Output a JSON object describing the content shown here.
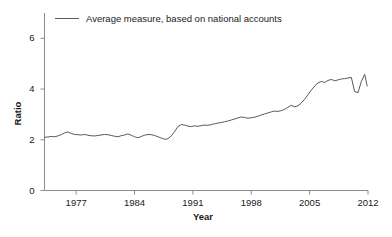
{
  "chart_data": {
    "type": "line",
    "title": "",
    "xlabel": "Year",
    "ylabel": "Ratio",
    "xlim": [
      1973.2,
      2012.0
    ],
    "ylim": [
      0,
      7.0
    ],
    "xticks": [
      1977,
      1984,
      1991,
      1998,
      2005,
      2012
    ],
    "xtick_labels": [
      "1977",
      "1984",
      "1991",
      "1998",
      "2005",
      "2012"
    ],
    "yticks": [
      0,
      2,
      4,
      6
    ],
    "ytick_labels": [
      "0",
      "2",
      "4",
      "6"
    ],
    "grid": false,
    "legend_position": "top-left",
    "line_color": "#595959",
    "axis_color": "#808080",
    "series": [
      {
        "name": "Average measure, based on national accounts",
        "x": [
          1973.2,
          1973.6,
          1974.0,
          1974.4,
          1974.8,
          1975.2,
          1975.6,
          1976.0,
          1976.4,
          1976.8,
          1977.2,
          1977.6,
          1978.0,
          1978.4,
          1978.8,
          1979.2,
          1979.6,
          1980.0,
          1980.4,
          1980.8,
          1981.2,
          1981.6,
          1982.0,
          1982.4,
          1982.8,
          1983.2,
          1983.6,
          1984.0,
          1984.4,
          1984.8,
          1985.2,
          1985.6,
          1986.0,
          1986.4,
          1986.8,
          1987.2,
          1987.6,
          1988.0,
          1988.4,
          1988.8,
          1989.2,
          1989.6,
          1990.0,
          1990.4,
          1990.8,
          1991.2,
          1991.6,
          1992.0,
          1992.4,
          1992.8,
          1993.2,
          1993.6,
          1994.0,
          1994.4,
          1994.8,
          1995.2,
          1995.6,
          1996.0,
          1996.4,
          1996.8,
          1997.2,
          1997.6,
          1998.0,
          1998.4,
          1998.8,
          1999.2,
          1999.6,
          2000.0,
          2000.4,
          2000.8,
          2001.2,
          2001.6,
          2002.0,
          2002.4,
          2002.8,
          2003.2,
          2003.6,
          2004.0,
          2004.4,
          2004.8,
          2005.2,
          2005.6,
          2006.0,
          2006.4,
          2006.8,
          2007.2,
          2007.6,
          2008.0,
          2008.4,
          2008.8,
          2009.2,
          2009.6,
          2010.0,
          2010.4,
          2010.8,
          2011.2,
          2011.6,
          2011.9
        ],
        "y": [
          2.1,
          2.11,
          2.13,
          2.12,
          2.15,
          2.2,
          2.27,
          2.31,
          2.25,
          2.21,
          2.2,
          2.19,
          2.21,
          2.18,
          2.16,
          2.15,
          2.17,
          2.19,
          2.21,
          2.2,
          2.17,
          2.14,
          2.12,
          2.16,
          2.19,
          2.23,
          2.18,
          2.12,
          2.08,
          2.13,
          2.18,
          2.21,
          2.2,
          2.17,
          2.12,
          2.07,
          2.02,
          2.04,
          2.15,
          2.32,
          2.52,
          2.6,
          2.58,
          2.54,
          2.52,
          2.55,
          2.53,
          2.56,
          2.58,
          2.57,
          2.6,
          2.63,
          2.66,
          2.68,
          2.71,
          2.74,
          2.78,
          2.82,
          2.86,
          2.9,
          2.88,
          2.85,
          2.87,
          2.89,
          2.93,
          2.98,
          3.02,
          3.06,
          3.1,
          3.13,
          3.12,
          3.15,
          3.2,
          3.28,
          3.36,
          3.3,
          3.34,
          3.45,
          3.6,
          3.78,
          3.96,
          4.12,
          4.24,
          4.3,
          4.26,
          4.34,
          4.38,
          4.33,
          4.36,
          4.4,
          4.41,
          4.44,
          4.46,
          3.9,
          3.86,
          4.3,
          4.58,
          4.12
        ]
      }
    ]
  },
  "legend": {
    "entries": [
      {
        "label": "Average measure, based on national accounts",
        "color": "#595959"
      }
    ]
  }
}
